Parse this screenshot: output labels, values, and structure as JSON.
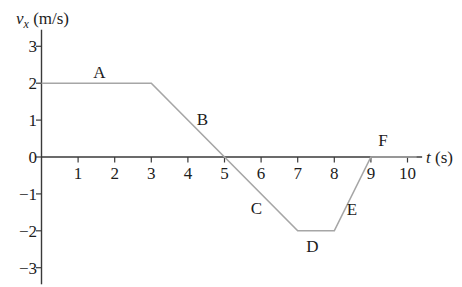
{
  "figure": {
    "background": "#ffffff",
    "description_texts": {
      "y_axis_title_variable": "v",
      "y_axis_title_subscript": "x",
      "y_axis_title_unit": "(m/s)",
      "x_axis_title_variable": "t",
      "x_axis_title_unit": "(s)"
    }
  },
  "chart_data": {
    "type": "line",
    "title": "",
    "xlabel": "t (s)",
    "ylabel": "vx (m/s)",
    "xlim": [
      0,
      10.4
    ],
    "ylim": [
      -3.45,
      3.45
    ],
    "grid": false,
    "x_axis": {
      "variable": "t",
      "unit": "(s)",
      "tick_values": [
        1,
        2,
        3,
        4,
        5,
        6,
        7,
        8,
        9,
        10
      ],
      "tick_labels": [
        "1",
        "2",
        "3",
        "4",
        "5",
        "6",
        "7",
        "8",
        "9",
        "10"
      ]
    },
    "y_axis": {
      "variable": "v",
      "subscript": "x",
      "unit": "(m/s)",
      "tick_values": [
        -3,
        -2,
        -1,
        0,
        1,
        2,
        3
      ],
      "tick_labels": [
        "−3",
        "−2",
        "−1",
        "0",
        "1",
        "2",
        "3"
      ]
    },
    "series": [
      {
        "name": "velocity-curve",
        "points": [
          [
            0,
            2
          ],
          [
            3,
            2
          ],
          [
            5,
            0
          ],
          [
            7,
            -2
          ],
          [
            8,
            -2
          ],
          [
            9,
            0
          ],
          [
            10.25,
            0
          ]
        ],
        "color": "#a6a6a6"
      }
    ],
    "segment_labels": [
      {
        "text": "A",
        "t": 1.58,
        "v": 2.3
      },
      {
        "text": "B",
        "t": 4.4,
        "v": 1.04
      },
      {
        "text": "C",
        "t": 5.87,
        "v": -1.38
      },
      {
        "text": "D",
        "t": 7.4,
        "v": -2.42
      },
      {
        "text": "E",
        "t": 8.48,
        "v": -1.4
      },
      {
        "text": "F",
        "t": 9.33,
        "v": 0.45
      }
    ],
    "colors": {
      "curve": "#a6a6a6",
      "axis": "#3a3a3a",
      "text": "#1c1c1c"
    }
  }
}
